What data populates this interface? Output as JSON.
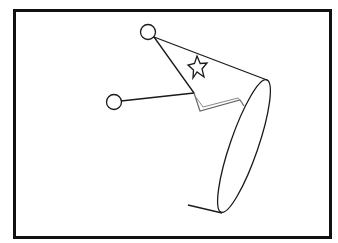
{
  "figure": {
    "stroke_color": "#1a1a1a",
    "frame_color": "#111111",
    "background": "#ffffff",
    "zigzag_color": "#555555",
    "elements": {
      "frame": "frame-border",
      "cone": "party-hat-cone",
      "star": "star-icon",
      "top_circle": "pompom-circle",
      "left_circle": "string-end-circle",
      "ellipse": "hat-rim-ellipse",
      "zigzag": "zigzag-trim",
      "bottom_line": "base-line"
    }
  }
}
